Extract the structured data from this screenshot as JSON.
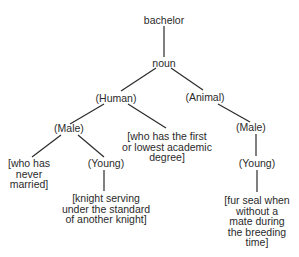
{
  "diagram": {
    "type": "semantic-tree",
    "root": "bachelor",
    "nodes": {
      "bachelor": "bachelor",
      "noun": "noun",
      "human": "(Human)",
      "animal": "(Animal)",
      "male_human": "(Male)",
      "male_animal": "(Male)",
      "young_human": "(Young)",
      "young_animal": "(Young)",
      "never_married": [
        "[who has",
        "never",
        "married]"
      ],
      "academic_degree": [
        "[who has the first",
        "or lowest academic",
        "degree]"
      ],
      "knight": [
        "[knight serving",
        "under the standard",
        "of another knight]"
      ],
      "fur_seal": [
        "[fur seal when",
        "without a",
        "mate during",
        "the breeding",
        "time]"
      ]
    },
    "edges": [
      [
        "bachelor",
        "noun"
      ],
      [
        "noun",
        "human"
      ],
      [
        "noun",
        "animal"
      ],
      [
        "human",
        "male_human"
      ],
      [
        "human",
        "academic_degree"
      ],
      [
        "male_human",
        "never_married"
      ],
      [
        "male_human",
        "young_human"
      ],
      [
        "young_human",
        "knight"
      ],
      [
        "animal",
        "male_animal"
      ],
      [
        "male_animal",
        "young_animal"
      ],
      [
        "young_animal",
        "fur_seal"
      ]
    ]
  }
}
